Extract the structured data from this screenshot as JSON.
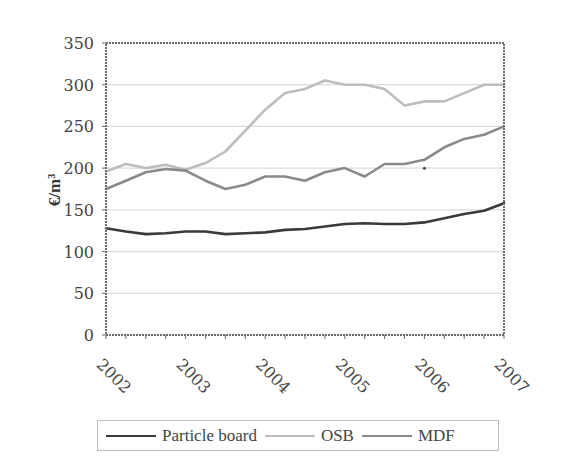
{
  "chart_data": {
    "type": "line",
    "title": "",
    "xlabel": "",
    "ylabel": "€/m³",
    "ylim": [
      0,
      350
    ],
    "yticks": [
      0,
      50,
      100,
      150,
      200,
      250,
      300,
      350
    ],
    "xtick_labels": [
      "2002",
      "2003",
      "2004",
      "2005",
      "2006",
      "2007"
    ],
    "x": [
      2002.0,
      2002.25,
      2002.5,
      2002.75,
      2003.0,
      2003.25,
      2003.5,
      2003.75,
      2004.0,
      2004.25,
      2004.5,
      2004.75,
      2005.0,
      2005.25,
      2005.5,
      2005.75,
      2006.0,
      2006.25,
      2006.5,
      2006.75,
      2007.0
    ],
    "grid": true,
    "legend_position": "bottom",
    "series": [
      {
        "name": "Particle board",
        "color": "#3a3a3a",
        "values": [
          128,
          124,
          121,
          122,
          124,
          124,
          121,
          122,
          123,
          126,
          127,
          130,
          133,
          134,
          133,
          133,
          135,
          140,
          145,
          149,
          158
        ]
      },
      {
        "name": "OSB",
        "color": "#bdbdbd",
        "values": [
          196,
          205,
          200,
          204,
          198,
          206,
          220,
          245,
          270,
          290,
          295,
          305,
          300,
          300,
          295,
          275,
          280,
          280,
          290,
          300,
          300
        ]
      },
      {
        "name": "MDF",
        "color": "#8a8a8a",
        "values": [
          175,
          185,
          195,
          199,
          197,
          185,
          175,
          180,
          190,
          190,
          185,
          195,
          200,
          190,
          205,
          205,
          210,
          225,
          235,
          240,
          250
        ]
      }
    ]
  },
  "legend": {
    "items": [
      {
        "label": "Particle board",
        "color": "#3a3a3a"
      },
      {
        "label": "OSB",
        "color": "#bdbdbd"
      },
      {
        "label": "MDF",
        "color": "#8a8a8a"
      }
    ]
  },
  "annotation_dot": {
    "x": 2006.0,
    "y": 200
  }
}
